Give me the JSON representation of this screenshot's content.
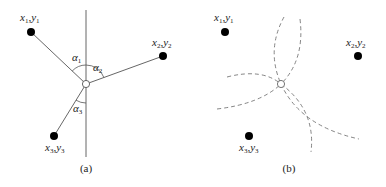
{
  "panel_a": {
    "caption": "(a)",
    "points": [
      {
        "x_label": "x",
        "x_sub": "1",
        "y_label": "y",
        "y_sub": "1"
      },
      {
        "x_label": "x",
        "x_sub": "2",
        "y_label": "y",
        "y_sub": "2"
      },
      {
        "x_label": "x",
        "x_sub": "3",
        "y_label": "y",
        "y_sub": "3"
      }
    ],
    "angles": [
      {
        "symbol": "α",
        "sub": "1"
      },
      {
        "symbol": "α",
        "sub": "2"
      },
      {
        "symbol": "α",
        "sub": "3"
      }
    ]
  },
  "panel_b": {
    "caption": "(b)",
    "points": [
      {
        "x_label": "x",
        "x_sub": "1",
        "y_label": "y",
        "y_sub": "1"
      },
      {
        "x_label": "x",
        "x_sub": "2",
        "y_label": "y",
        "y_sub": "2"
      },
      {
        "x_label": "x",
        "x_sub": "3",
        "y_label": "y",
        "y_sub": "3"
      }
    ]
  },
  "colors": {
    "line": "#555555",
    "dashed": "#777777",
    "point": "#000000"
  }
}
